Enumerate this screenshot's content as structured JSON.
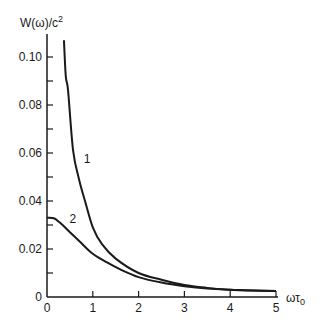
{
  "chart_data": {
    "type": "line",
    "title": "",
    "xlabel": "ωτ₀",
    "xlabel_parts": {
      "base": "ωτ",
      "sub": "0"
    },
    "ylabel": "W(ω)/c²",
    "ylabel_parts": {
      "base": "W(ω)/c",
      "sup": "2"
    },
    "xlim": [
      0,
      5
    ],
    "ylim": [
      0,
      0.11
    ],
    "x_ticks": [
      0,
      1,
      2,
      3,
      4,
      5
    ],
    "x_tick_labels": [
      "0",
      "1",
      "2",
      "3",
      "4",
      "5"
    ],
    "y_ticks_major": [
      0,
      0.02,
      0.04,
      0.06,
      0.08,
      0.1
    ],
    "y_tick_labels": [
      "0",
      "0.02",
      "0.04",
      "0.06",
      "0.08",
      "0.10"
    ],
    "y_ticks_minor": [
      0.01,
      0.03,
      0.05,
      0.07,
      0.09
    ],
    "grid": false,
    "legend": "none (curves labeled inline)",
    "series": [
      {
        "name": "1",
        "label_pos": {
          "x": 0.8,
          "y": 0.056
        },
        "x": [
          0.37,
          0.41,
          0.46,
          0.57,
          0.7,
          0.83,
          1.0,
          1.2,
          1.5,
          2.0,
          2.5,
          3.0,
          3.5,
          4.0,
          4.5,
          5.0
        ],
        "y": [
          0.107,
          0.092,
          0.086,
          0.061,
          0.049,
          0.04,
          0.029,
          0.022,
          0.016,
          0.01,
          0.0072,
          0.005,
          0.0038,
          0.003,
          0.0027,
          0.0025
        ]
      },
      {
        "name": "2",
        "label_pos": {
          "x": 0.49,
          "y": 0.031
        },
        "x": [
          0.0,
          0.15,
          0.28,
          0.5,
          0.72,
          1.0,
          1.3,
          1.6,
          2.0,
          2.5,
          3.0,
          3.5,
          4.0,
          4.5,
          5.0
        ],
        "y": [
          0.033,
          0.0328,
          0.031,
          0.027,
          0.023,
          0.018,
          0.0145,
          0.0115,
          0.0083,
          0.006,
          0.0045,
          0.0035,
          0.003,
          0.0027,
          0.0025
        ]
      }
    ]
  },
  "layout": {
    "origin_px": [
      47,
      297
    ],
    "px_per_x": 45.8,
    "px_per_y": 2400,
    "y_axis_top_px": 34,
    "x_axis_right_px": 278,
    "line_color": "#1a1a1a"
  }
}
